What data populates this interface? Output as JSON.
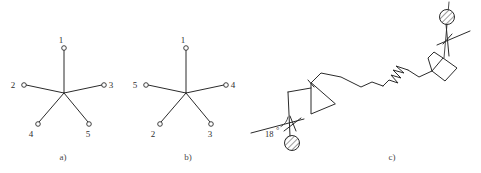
{
  "figure": {
    "background_color": "#ffffff",
    "line_color": "#2b2b2b",
    "width": 481,
    "height": 173
  },
  "panels": [
    {
      "id": "a",
      "caption": "a)",
      "caption_x": 63,
      "caption_y": 160,
      "type": "five-spoke-star",
      "hub": {
        "x": 64,
        "y": 93
      },
      "spokes": [
        {
          "label": "1",
          "node_x": 64,
          "node_y": 48,
          "label_x": 61,
          "label_y": 43
        },
        {
          "label": "2",
          "node_x": 24,
          "node_y": 85,
          "label_x": 13,
          "label_y": 88
        },
        {
          "label": "3",
          "node_x": 104,
          "node_y": 85,
          "label_x": 109,
          "label_y": 88
        },
        {
          "label": "4",
          "node_x": 38,
          "node_y": 124,
          "label_x": 30,
          "label_y": 136
        },
        {
          "label": "5",
          "node_x": 89,
          "node_y": 124,
          "label_x": 86,
          "label_y": 136
        }
      ]
    },
    {
      "id": "b",
      "caption": "b)",
      "caption_x": 188,
      "caption_y": 160,
      "type": "five-spoke-star",
      "hub": {
        "x": 186,
        "y": 93
      },
      "spokes": [
        {
          "label": "1",
          "node_x": 186,
          "node_y": 48,
          "label_x": 183,
          "label_y": 43
        },
        {
          "label": "5",
          "node_x": 146,
          "node_y": 85,
          "label_x": 135,
          "label_y": 88
        },
        {
          "label": "4",
          "node_x": 226,
          "node_y": 85,
          "label_x": 231,
          "label_y": 88
        },
        {
          "label": "2",
          "node_x": 160,
          "node_y": 124,
          "label_x": 152,
          "label_y": 136
        },
        {
          "label": "3",
          "node_x": 211,
          "node_y": 124,
          "label_x": 208,
          "label_y": 136
        }
      ]
    },
    {
      "id": "c",
      "caption": "c)",
      "caption_x": 392,
      "caption_y": 160,
      "type": "mechanism-linkage",
      "angle_annotation": {
        "value": "18",
        "unit_symbol": "°",
        "x": 271,
        "y": 136
      },
      "joints": [
        {
          "name": "lower-pin-joint",
          "cx": 292,
          "cy": 143,
          "r": 7.5
        },
        {
          "name": "upper-pin-joint",
          "cx": 447,
          "cy": 17,
          "r": 7.5
        }
      ],
      "break_symbol": {
        "x": 398,
        "y": 76
      }
    }
  ]
}
